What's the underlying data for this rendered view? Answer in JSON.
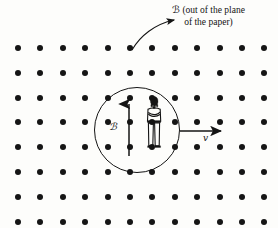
{
  "figure": {
    "kind": "physics-diagram",
    "background_color": "#fdfdfb",
    "ink_color": "#141414",
    "width": 278,
    "height": 228
  },
  "field_grid": {
    "icon": "dot-out-of-page-marker",
    "columns": 12,
    "rows": 8,
    "x_start": 18,
    "x_step": 22.4,
    "y_start": 48,
    "y_step": 24.8,
    "dot_diameter": 6,
    "dot_color": "#151515",
    "meaning": "uniform field directed out of the plane of the paper"
  },
  "region": {
    "shape": "circle",
    "center_x": 137,
    "center_y": 130,
    "radius": 43,
    "stroke_color": "#141414",
    "stroke_width": 1.4
  },
  "callout": {
    "symbol": "ℬ",
    "line1": "ℬ (out of the plane",
    "line2": "of the paper)",
    "symbol_text": "ℬ",
    "rest_line1": " (out of the plane",
    "arrow_icon": "curved-arrow-icon",
    "arrow_from_x": 132,
    "arrow_from_y": 50,
    "arrow_to_x": 178,
    "arrow_to_y": 20
  },
  "field_vector": {
    "label": "ℬ",
    "icon": "up-arrow-icon",
    "direction": "up",
    "x": 129,
    "tail_y": 156,
    "head_y": 102
  },
  "velocity_vector": {
    "label": "v",
    "icon": "right-arrow-icon",
    "direction": "right",
    "y": 131,
    "tail_x": 180,
    "head_x": 223
  },
  "observer": {
    "icon": "standing-person-icon",
    "description": "person standing with arms crossed",
    "x": 154,
    "y": 125
  }
}
